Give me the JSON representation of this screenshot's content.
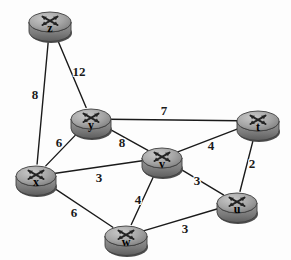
{
  "diagram": {
    "background_color": "#fdfdfd",
    "line_color": "#1a1a1a",
    "node_body_color": "#8e8e8e",
    "node_top_color": "#b0b0b0",
    "node_shadow_color": "#5a5a5a",
    "node_icon": "router-icon",
    "nodes": [
      {
        "id": "z",
        "label": "z",
        "x": 50,
        "y": 22,
        "rx": 21,
        "ry": 10
      },
      {
        "id": "y",
        "label": "y",
        "x": 91,
        "y": 119,
        "rx": 20,
        "ry": 10
      },
      {
        "id": "t",
        "label": "t",
        "x": 258,
        "y": 121,
        "rx": 21,
        "ry": 10
      },
      {
        "id": "v",
        "label": "v",
        "x": 162,
        "y": 158,
        "rx": 20,
        "ry": 10
      },
      {
        "id": "x",
        "label": "x",
        "x": 36,
        "y": 176,
        "rx": 20,
        "ry": 10
      },
      {
        "id": "u",
        "label": "u",
        "x": 237,
        "y": 203,
        "rx": 20,
        "ry": 10
      },
      {
        "id": "w",
        "label": "w",
        "x": 126,
        "y": 236,
        "rx": 21,
        "ry": 10
      }
    ],
    "edges": [
      {
        "id": "z-x",
        "from": "z",
        "to": "x",
        "weight": "8",
        "label_x": 35,
        "label_y": 94
      },
      {
        "id": "z-y",
        "from": "z",
        "to": "y",
        "weight": "12",
        "label_x": 79,
        "label_y": 71
      },
      {
        "id": "y-t",
        "from": "y",
        "to": "t",
        "weight": "7",
        "label_x": 164,
        "label_y": 110
      },
      {
        "id": "y-v",
        "from": "y",
        "to": "v",
        "weight": "8",
        "label_x": 122,
        "label_y": 142
      },
      {
        "id": "y-x",
        "from": "y",
        "to": "x",
        "weight": "6",
        "label_x": 59,
        "label_y": 142
      },
      {
        "id": "v-t",
        "from": "v",
        "to": "t",
        "weight": "4",
        "label_x": 211,
        "label_y": 145
      },
      {
        "id": "t-u",
        "from": "t",
        "to": "u",
        "weight": "2",
        "label_x": 252,
        "label_y": 163
      },
      {
        "id": "x-v",
        "from": "x",
        "to": "v",
        "weight": "3",
        "label_x": 99,
        "label_y": 177
      },
      {
        "id": "v-u",
        "from": "v",
        "to": "u",
        "weight": "3",
        "label_x": 197,
        "label_y": 180
      },
      {
        "id": "v-w",
        "from": "v",
        "to": "w",
        "weight": "4",
        "label_x": 138,
        "label_y": 199
      },
      {
        "id": "x-w",
        "from": "x",
        "to": "w",
        "weight": "6",
        "label_x": 74,
        "label_y": 212
      },
      {
        "id": "w-u",
        "from": "w",
        "to": "u",
        "weight": "3",
        "label_x": 185,
        "label_y": 228
      }
    ]
  }
}
